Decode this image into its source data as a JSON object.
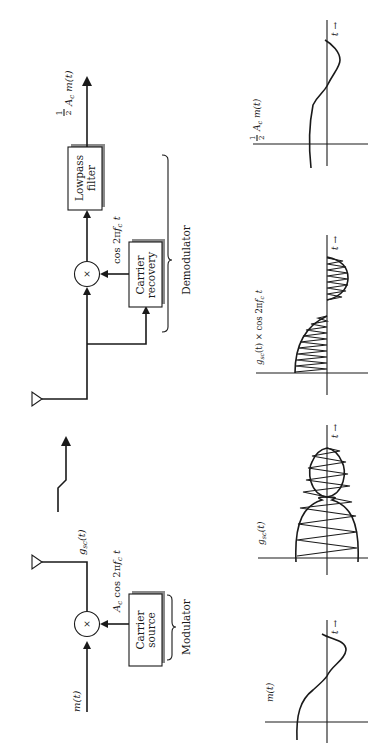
{
  "figure": {
    "orientation": "rotated-90-ccw",
    "modulator": {
      "label": "Modulator",
      "input_label": "m(t)",
      "multiplier_symbol": "×",
      "carrier_block": {
        "line1": "Carrier",
        "line2": "source"
      },
      "carrier_label": "A_c cos 2πf_c t",
      "carrier_label_parts": {
        "amp": "A",
        "amp_sub": "c",
        "cos": "cos 2π",
        "f": "f",
        "f_sub": "c",
        "t": "t"
      },
      "output_label": "g_sc(t)",
      "output_label_parts": {
        "g": "g",
        "sub": "sc",
        "arg": "(t)"
      }
    },
    "channel": {
      "label": "wireless-link"
    },
    "demodulator": {
      "label": "Demodulator",
      "multiplier_symbol": "×",
      "carrier_block": {
        "line1": "Carrier",
        "line2": "recovery"
      },
      "carrier_label_parts": {
        "cos": "cos 2π",
        "f": "f",
        "f_sub": "c",
        "t": "t"
      },
      "filter_block": {
        "line1": "Lowpass",
        "line2": "filter"
      },
      "output_label_parts": {
        "num": "1",
        "den": "2",
        "amp": "A",
        "amp_sub": "c",
        "m": "m(t)"
      }
    },
    "waveforms": [
      {
        "id": "m",
        "label": "m(t)",
        "time_label": "t →"
      },
      {
        "id": "gsc",
        "label_parts": {
          "g": "g",
          "sub": "sc",
          "arg": "(t)"
        },
        "time_label": "t →"
      },
      {
        "id": "product",
        "label_parts": {
          "g": "g",
          "sub": "sc",
          "arg": "(t) × cos 2π",
          "f": "f",
          "f_sub": "c",
          "t": " t"
        },
        "time_label": "t →"
      },
      {
        "id": "output",
        "label_parts": {
          "num": "1",
          "den": "2",
          "amp": "A",
          "amp_sub": "c",
          "m": "m(t)"
        },
        "time_label": "t →"
      }
    ]
  }
}
